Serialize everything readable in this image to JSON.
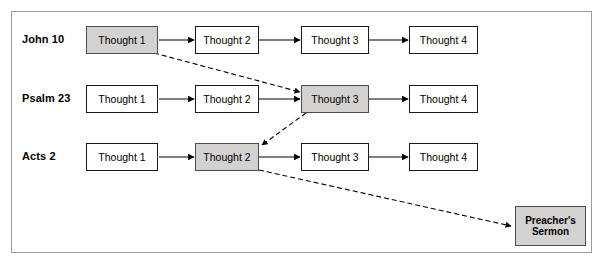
{
  "figure": {
    "border_color": "#9a9a9a",
    "background": "#ffffff"
  },
  "palette": {
    "node_fill": "#ffffff",
    "node_stroke": "#1a1a1a",
    "highlight_fill": "#d4d2d0",
    "highlight_stroke": "#4d4d4d",
    "arrow_solid": "#000000",
    "arrow_dashed": "#000000",
    "text": "#000000"
  },
  "rows": [
    {
      "label": "John 10",
      "nodes": [
        {
          "label": "Thought 1",
          "highlight": true
        },
        {
          "label": "Thought 2",
          "highlight": false
        },
        {
          "label": "Thought 3",
          "highlight": false
        },
        {
          "label": "Thought 4",
          "highlight": false
        }
      ]
    },
    {
      "label": "Psalm 23",
      "nodes": [
        {
          "label": "Thought 1",
          "highlight": false
        },
        {
          "label": "Thought 2",
          "highlight": false
        },
        {
          "label": "Thought 3",
          "highlight": true
        },
        {
          "label": "Thought 4",
          "highlight": false
        }
      ]
    },
    {
      "label": "Acts 2",
      "nodes": [
        {
          "label": "Thought 1",
          "highlight": false
        },
        {
          "label": "Thought 2",
          "highlight": true
        },
        {
          "label": "Thought 3",
          "highlight": false
        },
        {
          "label": "Thought 4",
          "highlight": false
        }
      ]
    }
  ],
  "sermon": {
    "line1": "Preacher's",
    "line2": "Sermon",
    "highlight": true
  },
  "connections": {
    "solid": [
      {
        "from": "john10.thought1",
        "to": "john10.thought2"
      },
      {
        "from": "john10.thought2",
        "to": "john10.thought3"
      },
      {
        "from": "john10.thought3",
        "to": "john10.thought4"
      },
      {
        "from": "psalm23.thought1",
        "to": "psalm23.thought2"
      },
      {
        "from": "psalm23.thought2",
        "to": "psalm23.thought3"
      },
      {
        "from": "psalm23.thought3",
        "to": "psalm23.thought4"
      },
      {
        "from": "acts2.thought1",
        "to": "acts2.thought2"
      },
      {
        "from": "acts2.thought2",
        "to": "acts2.thought3"
      },
      {
        "from": "acts2.thought3",
        "to": "acts2.thought4"
      }
    ],
    "dashed": [
      {
        "from": "john10.thought1",
        "to": "psalm23.thought3"
      },
      {
        "from": "psalm23.thought3",
        "to": "acts2.thought2"
      },
      {
        "from": "acts2.thought2",
        "to": "sermon"
      }
    ]
  }
}
